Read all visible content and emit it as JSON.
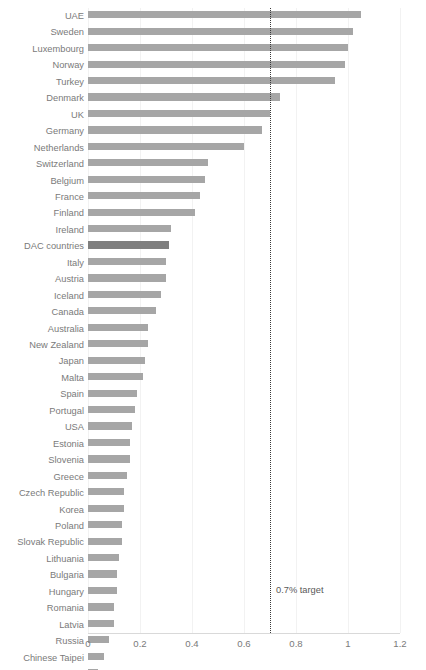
{
  "chart_data": {
    "type": "bar",
    "orientation": "horizontal",
    "title": "",
    "xlabel": "",
    "ylabel": "",
    "xlim": [
      0,
      1.2
    ],
    "xticks": [
      "0",
      "0.2",
      "0.4",
      "0.6",
      "0.8",
      "1",
      "1.2"
    ],
    "xtick_values": [
      0,
      0.2,
      0.4,
      0.6,
      0.8,
      1,
      1.2
    ],
    "grid": "vertical-light",
    "legend": "none",
    "bar_color": "#a6a6a6",
    "highlight_color": "#7f7f7f",
    "highlight_category": "DAC countries",
    "annotation": {
      "label": "0.7% target",
      "value": 0.7,
      "style": "dotted vertical line"
    },
    "categories": [
      "UAE",
      "Sweden",
      "Luxembourg",
      "Norway",
      "Turkey",
      "Denmark",
      "UK",
      "Germany",
      "Netherlands",
      "Switzerland",
      "Belgium",
      "France",
      "Finland",
      "Ireland",
      "DAC countries",
      "Italy",
      "Austria",
      "Iceland",
      "Canada",
      "Australia",
      "New Zealand",
      "Japan",
      "Malta",
      "Spain",
      "Portugal",
      "USA",
      "Estonia",
      "Slovenia",
      "Greece",
      "Czech Republic",
      "Korea",
      "Poland",
      "Slovak Republic",
      "Lithuania",
      "Bulgaria",
      "Hungary",
      "Romania",
      "Latvia",
      "Russia",
      "Chinese Taipei",
      "Thailand"
    ],
    "values": [
      1.05,
      1.02,
      1.0,
      0.99,
      0.95,
      0.74,
      0.7,
      0.67,
      0.6,
      0.46,
      0.45,
      0.43,
      0.41,
      0.32,
      0.31,
      0.3,
      0.3,
      0.28,
      0.26,
      0.23,
      0.23,
      0.22,
      0.21,
      0.19,
      0.18,
      0.17,
      0.16,
      0.16,
      0.15,
      0.14,
      0.14,
      0.13,
      0.13,
      0.12,
      0.11,
      0.11,
      0.1,
      0.1,
      0.08,
      0.06,
      0.04
    ]
  }
}
